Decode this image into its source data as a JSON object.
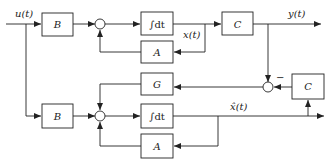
{
  "diagram": {
    "type": "block-diagram",
    "signals": {
      "input": "u(t)",
      "output": "y(t)",
      "state": "x(t)",
      "estimate": "x̂(t)",
      "minus_sign": "−"
    },
    "plant": {
      "input_gain": "B",
      "integrator": "∫dt",
      "feedback": "A",
      "output_gain": "C"
    },
    "observer": {
      "input_gain": "B",
      "integrator": "∫dt",
      "feedback": "A",
      "output_gain": "C",
      "correction_gain": "G"
    },
    "nodes": [
      {
        "id": "B1",
        "label": "B"
      },
      {
        "id": "S1",
        "label": "sum"
      },
      {
        "id": "I1",
        "label": "∫dt"
      },
      {
        "id": "A1",
        "label": "A"
      },
      {
        "id": "C1",
        "label": "C"
      },
      {
        "id": "G",
        "label": "G"
      },
      {
        "id": "S3",
        "label": "sum"
      },
      {
        "id": "C2",
        "label": "C"
      },
      {
        "id": "B2",
        "label": "B"
      },
      {
        "id": "S2",
        "label": "sum"
      },
      {
        "id": "I2",
        "label": "∫dt"
      },
      {
        "id": "A2",
        "label": "A"
      }
    ],
    "edges": [
      {
        "from": "u(t)",
        "to": "B1"
      },
      {
        "from": "u(t)",
        "to": "B2"
      },
      {
        "from": "B1",
        "to": "S1"
      },
      {
        "from": "S1",
        "to": "I1"
      },
      {
        "from": "I1",
        "to": "C1",
        "label": "x(t)"
      },
      {
        "from": "I1",
        "to": "A1"
      },
      {
        "from": "A1",
        "to": "S1"
      },
      {
        "from": "C1",
        "to": "y(t)"
      },
      {
        "from": "C1",
        "to": "S3"
      },
      {
        "from": "C2",
        "to": "S3",
        "sign": "−"
      },
      {
        "from": "S3",
        "to": "G"
      },
      {
        "from": "G",
        "to": "S2"
      },
      {
        "from": "B2",
        "to": "S2"
      },
      {
        "from": "S2",
        "to": "I2"
      },
      {
        "from": "I2",
        "to": "output",
        "label": "x̂(t)"
      },
      {
        "from": "I2",
        "to": "A2"
      },
      {
        "from": "A2",
        "to": "S2"
      },
      {
        "from": "I2",
        "to": "C2"
      }
    ]
  }
}
